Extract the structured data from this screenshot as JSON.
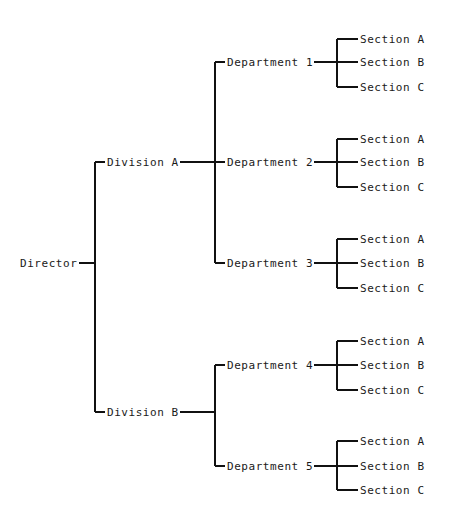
{
  "diagram": {
    "kind": "organizational-tree",
    "title": "",
    "line_color": "#111111",
    "text_color": "#1a1a1a",
    "background": "#ffffff",
    "root": {
      "label": "Director",
      "x": 20,
      "y": 263,
      "stub_x": 95
    },
    "columns": {
      "root_spine_x": 95,
      "division_text_x": 107,
      "division_spine_x": 215,
      "department_text_x": 227,
      "department_spine_x": 337,
      "section_text_x": 360
    },
    "divisions": [
      {
        "label": "Division A",
        "y": 162,
        "departments": [
          {
            "label": "Department 1",
            "y": 62,
            "sections": [
              {
                "label": "Section A",
                "y": 39
              },
              {
                "label": "Section B",
                "y": 62
              },
              {
                "label": "Section C",
                "y": 87
              }
            ]
          },
          {
            "label": "Department 2",
            "y": 162,
            "sections": [
              {
                "label": "Section A",
                "y": 139
              },
              {
                "label": "Section B",
                "y": 162
              },
              {
                "label": "Section C",
                "y": 187
              }
            ]
          },
          {
            "label": "Department 3",
            "y": 263,
            "sections": [
              {
                "label": "Section A",
                "y": 239
              },
              {
                "label": "Section B",
                "y": 263
              },
              {
                "label": "Section C",
                "y": 288
              }
            ]
          }
        ]
      },
      {
        "label": "Division B",
        "y": 412,
        "departments": [
          {
            "label": "Department 4",
            "y": 365,
            "sections": [
              {
                "label": "Section A",
                "y": 341
              },
              {
                "label": "Section B",
                "y": 365
              },
              {
                "label": "Section C",
                "y": 390
              }
            ]
          },
          {
            "label": "Department 5",
            "y": 466,
            "sections": [
              {
                "label": "Section A",
                "y": 441
              },
              {
                "label": "Section B",
                "y": 466
              },
              {
                "label": "Section C",
                "y": 490
              }
            ]
          }
        ]
      }
    ]
  }
}
